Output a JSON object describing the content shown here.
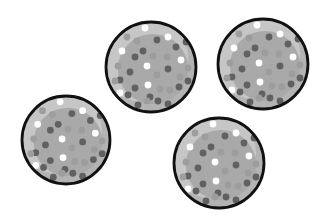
{
  "scene": {
    "description": "Four identical gray speckled balls with black outlines on white background",
    "background": "#ffffff",
    "colors": {
      "outline": "#111111",
      "body": "#b3b3b3",
      "body_light": "#c6c6c6",
      "body_shade": "#a9a9a9",
      "dot_dark": "#616161",
      "dot_light": "#9d9d9d",
      "dot_white": "#ffffff"
    },
    "balls": [
      {
        "id": "ball-left",
        "cx": 66,
        "cy": 140,
        "r": 44
      },
      {
        "id": "ball-top-middle",
        "cx": 151,
        "cy": 67,
        "r": 45
      },
      {
        "id": "ball-top-right",
        "cx": 263,
        "cy": 64,
        "r": 45
      },
      {
        "id": "ball-bottom-right",
        "cx": 219,
        "cy": 163,
        "r": 45
      }
    ],
    "dots": [
      {
        "dx": -6,
        "dy": -39,
        "t": "w"
      },
      {
        "dx": 17,
        "dy": -30,
        "t": "w"
      },
      {
        "dx": -14,
        "dy": -26,
        "t": "l"
      },
      {
        "dx": 6,
        "dy": -27,
        "t": "d"
      },
      {
        "dx": 35,
        "dy": -25,
        "t": "d"
      },
      {
        "dx": -29,
        "dy": -16,
        "t": "w"
      },
      {
        "dx": -8,
        "dy": -16,
        "t": "d"
      },
      {
        "dx": -16,
        "dy": -10,
        "t": "d"
      },
      {
        "dx": 25,
        "dy": -20,
        "t": "d"
      },
      {
        "dx": 30,
        "dy": -7,
        "t": "w"
      },
      {
        "dx": 2,
        "dy": -11,
        "t": "l"
      },
      {
        "dx": 16,
        "dy": -10,
        "t": "l"
      },
      {
        "dx": -4,
        "dy": -1,
        "t": "w"
      },
      {
        "dx": -33,
        "dy": -1,
        "t": "l"
      },
      {
        "dx": 17,
        "dy": 2,
        "t": "d"
      },
      {
        "dx": 37,
        "dy": 1,
        "t": "l"
      },
      {
        "dx": -21,
        "dy": 5,
        "t": "d"
      },
      {
        "dx": 6,
        "dy": 8,
        "t": "l"
      },
      {
        "dx": 29,
        "dy": 10,
        "t": "l"
      },
      {
        "dx": -31,
        "dy": 13,
        "t": "d"
      },
      {
        "dx": -3,
        "dy": 18,
        "t": "w"
      },
      {
        "dx": -16,
        "dy": 21,
        "t": "d"
      },
      {
        "dx": 9,
        "dy": 22,
        "t": "l"
      },
      {
        "dx": 28,
        "dy": 20,
        "t": "d"
      },
      {
        "dx": 19,
        "dy": 23,
        "t": "l"
      },
      {
        "dx": -23,
        "dy": 28,
        "t": "d"
      },
      {
        "dx": -31,
        "dy": 26,
        "t": "w"
      },
      {
        "dx": -1,
        "dy": 30,
        "t": "d"
      },
      {
        "dx": 7,
        "dy": 34,
        "t": "d"
      },
      {
        "dx": -13,
        "dy": 38,
        "t": "d"
      },
      {
        "dx": -4,
        "dy": 34,
        "t": "l"
      },
      {
        "dx": 17,
        "dy": 37,
        "t": "d"
      },
      {
        "dx": 34,
        "dy": 31,
        "t": "l"
      },
      {
        "dx": 37,
        "dy": 14,
        "t": "d"
      },
      {
        "dx": -24,
        "dy": -30,
        "t": "l"
      },
      {
        "dx": -36,
        "dy": 14,
        "t": "l"
      }
    ],
    "dot_radius": 3.4
  }
}
